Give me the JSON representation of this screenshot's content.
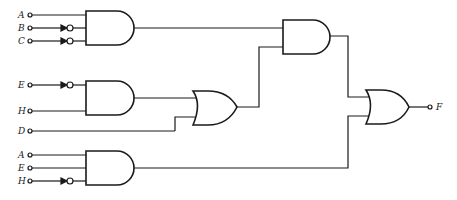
{
  "diagram": {
    "type": "combinational-logic-circuit",
    "inputs": {
      "g1": [
        "A",
        "B",
        "C"
      ],
      "g2": [
        "E",
        "H"
      ],
      "d": "D",
      "g5": [
        "A",
        "E",
        "H"
      ]
    },
    "output": "F",
    "gates": [
      {
        "id": "g1",
        "type": "AND",
        "inputs": [
          "A",
          "NOT B",
          "NOT C"
        ]
      },
      {
        "id": "g2",
        "type": "AND",
        "inputs": [
          "NOT E",
          "H"
        ]
      },
      {
        "id": "g3",
        "type": "OR",
        "inputs": [
          "g2",
          "D"
        ]
      },
      {
        "id": "g4",
        "type": "AND",
        "inputs": [
          "g1",
          "g3"
        ]
      },
      {
        "id": "g5",
        "type": "AND",
        "inputs": [
          "A",
          "E",
          "NOT H"
        ]
      },
      {
        "id": "g6",
        "type": "OR",
        "inputs": [
          "g4",
          "g5"
        ],
        "output": "F"
      }
    ],
    "colors": {
      "ink": "#1a1a1a",
      "background": "#ffffff"
    }
  }
}
